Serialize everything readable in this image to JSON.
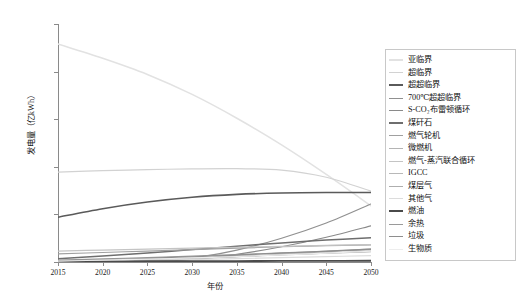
{
  "chart_data": {
    "type": "line",
    "title": "",
    "xlabel": "年份",
    "ylabel": "发电量（亿kWh）",
    "xlim": [
      2015,
      2050
    ],
    "ylim": [
      0,
      25000
    ],
    "grid": false,
    "legend_position": "right",
    "x": [
      2015,
      2020,
      2025,
      2030,
      2035,
      2040,
      2045,
      2050
    ],
    "xtick_labels": [
      "2015",
      "2020",
      "2025",
      "2030",
      "2035",
      "2040",
      "2045",
      "2050"
    ],
    "ytick_labels": [
      "0",
      "5000",
      "10 000",
      "15 000",
      "20 000",
      "25 000"
    ],
    "ytick_values": [
      0,
      5000,
      10000,
      15000,
      20000,
      25000
    ],
    "series": [
      {
        "name": "亚临界",
        "color": "#e2e2e2",
        "width": 1.5,
        "values": [
          22900,
          21400,
          19700,
          17600,
          15100,
          12300,
          9200,
          5900
        ]
      },
      {
        "name": "超临界",
        "color": "#d2d2d2",
        "width": 1.2,
        "values": [
          9450,
          9600,
          9700,
          9780,
          9800,
          9650,
          8900,
          7450
        ]
      },
      {
        "name": "超超临界",
        "color": "#5a5a5a",
        "width": 1.6,
        "values": [
          4700,
          5600,
          6300,
          6800,
          7100,
          7250,
          7300,
          7300
        ]
      },
      {
        "name": "700℃超超临界",
        "color": "#909090",
        "width": 1.2,
        "values": [
          0,
          0,
          60,
          420,
          1250,
          2500,
          4100,
          6100
        ]
      },
      {
        "name": "S-CO₂布雷顿循环",
        "color": "#8a8a8a",
        "width": 1.2,
        "values": [
          0,
          0,
          30,
          260,
          800,
          1600,
          2600,
          3800
        ]
      },
      {
        "name": "煤矸石",
        "color": "#6e6e6e",
        "width": 1.5,
        "values": [
          350,
          620,
          950,
          1300,
          1650,
          2000,
          2300,
          2550
        ]
      },
      {
        "name": "燃气轮机",
        "color": "#a0a0a0",
        "width": 1.2,
        "values": [
          850,
          1000,
          1150,
          1300,
          1450,
          1600,
          1720,
          1800
        ]
      },
      {
        "name": "微燃机",
        "color": "#b4b4b4",
        "width": 1.2,
        "values": [
          80,
          150,
          260,
          400,
          560,
          740,
          930,
          1120
        ]
      },
      {
        "name": "燃气-蒸汽联合循环",
        "color": "#c4c4c4",
        "width": 1.2,
        "values": [
          1150,
          1250,
          1350,
          1450,
          1550,
          1650,
          1740,
          1820
        ]
      },
      {
        "name": "IGCC",
        "color": "#b8b8b8",
        "width": 1.2,
        "values": [
          30,
          90,
          200,
          360,
          560,
          800,
          1080,
          1380
        ]
      },
      {
        "name": "煤层气",
        "color": "#aeaeae",
        "width": 1.2,
        "values": [
          120,
          210,
          320,
          450,
          600,
          760,
          930,
          1100
        ]
      },
      {
        "name": "其他气",
        "color": "#dcdcdc",
        "width": 1.2,
        "values": [
          60,
          110,
          180,
          260,
          350,
          450,
          560,
          680
        ]
      },
      {
        "name": "燃油",
        "color": "#4a4a4a",
        "width": 1.8,
        "values": [
          60,
          70,
          80,
          90,
          100,
          110,
          120,
          130
        ]
      },
      {
        "name": "余热",
        "color": "#9a9a9a",
        "width": 1.2,
        "values": [
          200,
          330,
          470,
          620,
          780,
          950,
          1120,
          1290
        ]
      },
      {
        "name": "垃圾",
        "color": "#8e8e8e",
        "width": 1.2,
        "values": [
          140,
          250,
          390,
          550,
          730,
          930,
          1140,
          1360
        ]
      },
      {
        "name": "生物质",
        "color": "#ededed",
        "width": 1.2,
        "values": [
          100,
          190,
          300,
          430,
          580,
          750,
          930,
          1130
        ]
      }
    ]
  },
  "legend": {
    "items": [
      {
        "label": "亚临界"
      },
      {
        "label": "超临界"
      },
      {
        "label": "超超临界"
      },
      {
        "label": "700℃超超临界"
      },
      {
        "label": "S-CO₂布雷顿循环"
      },
      {
        "label": "煤矸石"
      },
      {
        "label": "燃气轮机"
      },
      {
        "label": "微燃机"
      },
      {
        "label": "燃气-蒸汽联合循环"
      },
      {
        "label": "IGCC"
      },
      {
        "label": "煤层气"
      },
      {
        "label": "其他气"
      },
      {
        "label": "燃油"
      },
      {
        "label": "余热"
      },
      {
        "label": "垃圾"
      },
      {
        "label": "生物质"
      }
    ]
  }
}
